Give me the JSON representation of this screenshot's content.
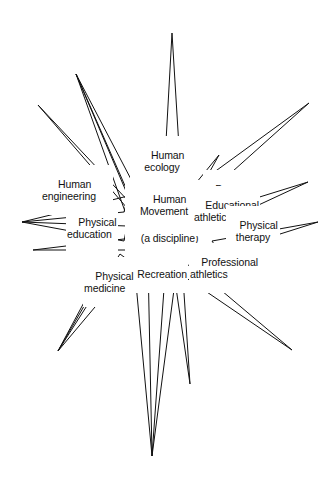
{
  "diagram": {
    "title": "Human Movement Phenomena (a discipline)",
    "type": "starburst-radial-concept-diagram",
    "background_color": "#ffffff",
    "stroke_color": "#111111",
    "stroke_width": 1,
    "canvas": {
      "width": 333,
      "height": 486
    },
    "center": {
      "x": 152,
      "y": 243
    },
    "labels": [
      {
        "id": "human-ecology",
        "text": "Human\necology",
        "x": 143,
        "y": 137,
        "align": "ctr"
      },
      {
        "id": "human-engineering",
        "text": "Human\nengineering",
        "x": 33,
        "y": 166,
        "align": "ctr"
      },
      {
        "id": "human-movement",
        "text": "Human\nMovement\nPhenomena",
        "x": 140,
        "y": 181,
        "align": "ctr"
      },
      {
        "id": "a-discipline",
        "text": "(a discipline)",
        "x": 140,
        "y": 221,
        "align": "ctr"
      },
      {
        "id": "dance",
        "text": "Dance",
        "x": 203,
        "y": 172,
        "align": "lft"
      },
      {
        "id": "educational-athletics",
        "text": "Educational\nathletics",
        "x": 195,
        "y": 187,
        "align": "lft"
      },
      {
        "id": "physical-education",
        "text": "Physical\neducation",
        "x": 66,
        "y": 204,
        "align": "lft"
      },
      {
        "id": "physical-therapy",
        "text": "Physical\ntherapy",
        "x": 248,
        "y": 207,
        "align": "ctr"
      },
      {
        "id": "recreation",
        "text": "Recreation",
        "x": 126,
        "y": 256,
        "align": "lft"
      },
      {
        "id": "professional-athletics",
        "text": "Professional\nathletics",
        "x": 192,
        "y": 245,
        "align": "lft"
      },
      {
        "id": "physical-medicine",
        "text": "Physical\nmedicine",
        "x": 83,
        "y": 258,
        "align": "lft"
      }
    ],
    "spikes": [
      {
        "id": "spike-up-center",
        "points": "172,33 164,233 183,232",
        "label": "human-ecology"
      },
      {
        "id": "spike-up-left-long",
        "points": "76,74 139,236 154,228",
        "label": "human-ecology-left"
      },
      {
        "id": "spike-up-left-thin",
        "points": "76,74 131,228 143,221",
        "label": "upper-left-thin"
      },
      {
        "id": "spike-left-upper",
        "points": "38,105 138,222 133,206",
        "label": "human-engineering"
      },
      {
        "id": "spike-left-mid-a",
        "points": "22,222 127,197 125,213",
        "label": "physical-education-upper"
      },
      {
        "id": "spike-left-mid-b",
        "points": "22,222 121,240 126,225",
        "label": "physical-education-lower"
      },
      {
        "id": "spike-left-low",
        "points": "33,250 130,239 126,250",
        "label": "left-low"
      },
      {
        "id": "spike-left-down",
        "points": "58,351 118,253 131,262",
        "label": "physical-medicine-down"
      },
      {
        "id": "spike-left-down-b",
        "points": "58,351 104,266 113,257",
        "label": "physical-medicine-down-b"
      },
      {
        "id": "spike-down-left",
        "points": "152,456 135,262 147,262",
        "label": "recreation-down"
      },
      {
        "id": "spike-down-right",
        "points": "152,456 165,261 176,266",
        "label": "recreation-down-right"
      },
      {
        "id": "spike-down-mid-right",
        "points": "190,384 174,266 183,263",
        "label": "down-mid-right"
      },
      {
        "id": "spike-right-down",
        "points": "292,350 189,263 179,272",
        "label": "professional-athletics-down"
      },
      {
        "id": "spike-right-low",
        "points": "318,222 213,242 220,252",
        "label": "physical-therapy-low"
      },
      {
        "id": "spike-right-mid",
        "points": "308,182 196,218 206,228",
        "label": "physical-therapy-mid"
      },
      {
        "id": "spike-right-up",
        "points": "309,103 192,190 203,196",
        "label": "educational-athletics-up"
      },
      {
        "id": "spike-up-right-small",
        "points": "219,155 188,194 199,190",
        "label": "dance"
      },
      {
        "id": "spike-center-diamond",
        "points": "144,158 138,185 149,200 153,173",
        "label": "center-notch"
      }
    ]
  }
}
